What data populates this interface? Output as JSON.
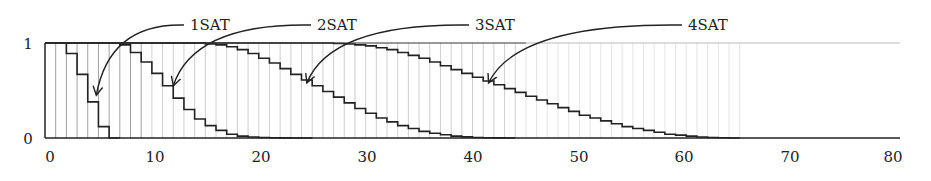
{
  "chart_data": {
    "type": "line",
    "subtype": "step",
    "title": "",
    "xlabel": "",
    "ylabel": "",
    "xlim": [
      0,
      80
    ],
    "ylim": [
      0,
      1
    ],
    "x_ticks": [
      0,
      10,
      20,
      30,
      40,
      50,
      60,
      70,
      80
    ],
    "x_tick_labels": [
      "0",
      "10",
      "20",
      "30",
      "40",
      "50",
      "60",
      "70",
      "80"
    ],
    "y_ticks": [
      0,
      1
    ],
    "y_tick_labels": [
      "0",
      "1"
    ],
    "grid": "vertical lines at each integer x",
    "legend": "none (curves labeled with arrow annotations)",
    "series": [
      {
        "name": "1SAT",
        "x": [
          0,
          1,
          2,
          3,
          4,
          5,
          6
        ],
        "values": [
          1.0,
          1.0,
          0.89,
          0.67,
          0.38,
          0.12,
          0.0
        ]
      },
      {
        "name": "2SAT",
        "x": [
          0,
          1,
          2,
          3,
          4,
          5,
          6,
          7,
          8,
          9,
          10,
          11,
          12,
          13,
          14,
          15,
          16,
          17,
          18,
          19,
          20,
          21,
          22,
          23,
          24
        ],
        "values": [
          1.0,
          1.0,
          1.0,
          1.0,
          1.0,
          1.0,
          1.0,
          0.98,
          0.9,
          0.8,
          0.68,
          0.55,
          0.42,
          0.3,
          0.2,
          0.13,
          0.08,
          0.04,
          0.02,
          0.01,
          0.005,
          0.002,
          0.001,
          0.0,
          0.0
        ]
      },
      {
        "name": "3SAT",
        "x": [
          0,
          14,
          15,
          16,
          17,
          18,
          19,
          20,
          21,
          22,
          23,
          24,
          25,
          26,
          27,
          28,
          29,
          30,
          31,
          32,
          33,
          34,
          35,
          36,
          37,
          38,
          39,
          40,
          41,
          42,
          43
        ],
        "values": [
          1.0,
          1.0,
          0.99,
          0.98,
          0.96,
          0.93,
          0.89,
          0.84,
          0.79,
          0.73,
          0.67,
          0.61,
          0.55,
          0.49,
          0.43,
          0.37,
          0.31,
          0.26,
          0.21,
          0.17,
          0.13,
          0.1,
          0.07,
          0.05,
          0.035,
          0.02,
          0.012,
          0.006,
          0.003,
          0.001,
          0.0
        ]
      },
      {
        "name": "4SAT",
        "x": [
          0,
          26,
          27,
          28,
          29,
          30,
          31,
          32,
          33,
          34,
          35,
          36,
          37,
          38,
          39,
          40,
          41,
          42,
          43,
          44,
          45,
          46,
          47,
          48,
          49,
          50,
          51,
          52,
          53,
          54,
          55,
          56,
          57,
          58,
          59,
          60,
          61,
          62,
          63,
          64
        ],
        "values": [
          1.0,
          1.0,
          0.995,
          0.99,
          0.98,
          0.97,
          0.95,
          0.93,
          0.9,
          0.87,
          0.84,
          0.8,
          0.76,
          0.72,
          0.68,
          0.64,
          0.6,
          0.56,
          0.52,
          0.48,
          0.44,
          0.4,
          0.36,
          0.32,
          0.28,
          0.24,
          0.21,
          0.18,
          0.15,
          0.12,
          0.1,
          0.08,
          0.06,
          0.04,
          0.03,
          0.02,
          0.01,
          0.005,
          0.002,
          0.0
        ]
      }
    ],
    "annotations": [
      {
        "text": "1SAT",
        "label_pos": [
          190,
          30
        ],
        "arrow_to_x": 4.8,
        "arrow_to_y": 0.45
      },
      {
        "text": "2SAT",
        "label_pos": [
          317,
          30
        ],
        "arrow_to_x": 12.0,
        "arrow_to_y": 0.55
      },
      {
        "text": "3SAT",
        "label_pos": [
          475,
          30
        ],
        "arrow_to_x": 24.5,
        "arrow_to_y": 0.58
      },
      {
        "text": "4SAT",
        "label_pos": [
          688,
          30
        ],
        "arrow_to_x": 41.5,
        "arrow_to_y": 0.58
      }
    ]
  },
  "axes": {
    "x_tick_labels": [
      "0",
      "10",
      "20",
      "30",
      "40",
      "50",
      "60",
      "70",
      "80"
    ],
    "y_tick_labels": [
      "0",
      "1"
    ]
  },
  "labels": {
    "series_1": "1SAT",
    "series_2": "2SAT",
    "series_3": "3SAT",
    "series_4": "4SAT"
  }
}
